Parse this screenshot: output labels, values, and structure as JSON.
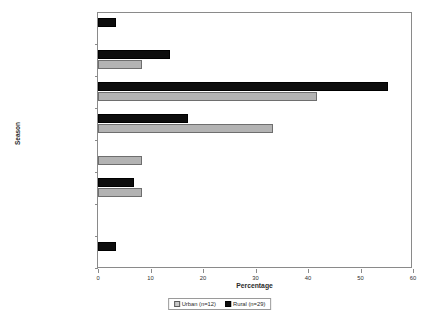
{
  "chart_data": {
    "type": "bar",
    "orientation": "horizontal",
    "title": "",
    "xlabel": "Percentage",
    "ylabel": "Season",
    "xlim": [
      0,
      60
    ],
    "xticks": [
      0,
      10,
      20,
      30,
      40,
      50,
      60
    ],
    "grid": false,
    "legend_position": "bottom",
    "categories": [
      "Summer",
      "Late summer/early fall",
      "Fall",
      "Late fall/early winter",
      "Winter",
      "Late winter/early spring",
      "Spring",
      "Late spring/early summer"
    ],
    "series": [
      {
        "name": "Urban (n=12)",
        "label": "Urban",
        "n": 12,
        "color": "#b3b3b3",
        "values": [
          0,
          8.3,
          41.7,
          33.3,
          8.3,
          8.3,
          0,
          0
        ]
      },
      {
        "name": "Rural (n=29)",
        "label": "Rural",
        "n": 29,
        "color": "#0d0d0d",
        "values": [
          3.4,
          13.8,
          55.2,
          17.2,
          0,
          6.9,
          0,
          3.4
        ]
      }
    ]
  },
  "legend": {
    "urban_label": "Urban (n=12)",
    "rural_label": "Rural (n=29)"
  },
  "axes": {
    "x_title": "Percentage",
    "y_title": "Season"
  }
}
